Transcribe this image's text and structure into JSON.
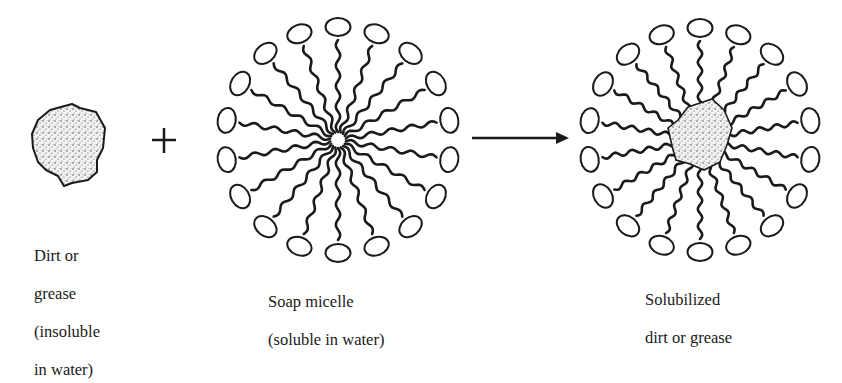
{
  "figure": {
    "stages": [
      {
        "id": "dirt",
        "label_lines": [
          "Dirt or",
          "grease",
          "(insoluble",
          "in water)"
        ]
      },
      {
        "id": "micelle",
        "label_lines": [
          "Soap micelle",
          "(soluble in water)"
        ]
      },
      {
        "id": "solubilized",
        "label_lines": [
          "Solubilized",
          "dirt or grease"
        ]
      }
    ],
    "operator_symbol": "+",
    "reaction_arrow": "→",
    "micelle": {
      "head_count": 18,
      "head_shape": "ellipse",
      "tail_shape": "wavy-line"
    },
    "colors": {
      "ink": "#1a1a1a",
      "background": "#ffffff"
    }
  }
}
